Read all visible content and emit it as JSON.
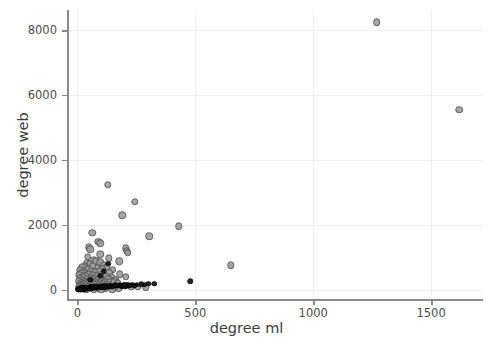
{
  "chart_data": {
    "type": "scatter",
    "title": "",
    "xlabel": "degree ml",
    "ylabel": "degree web",
    "xlim": [
      -40,
      1720
    ],
    "ylim": [
      -320,
      8620
    ],
    "xticks": [
      0,
      500,
      1000,
      1500
    ],
    "yticks": [
      0,
      2000,
      4000,
      6000,
      8000
    ],
    "xticklabels": [
      "0",
      "500",
      "1000",
      "1500"
    ],
    "yticklabels": [
      "0",
      "2000",
      "4000",
      "6000",
      "8000"
    ],
    "grid": true,
    "grid_color": "#f0f0f0",
    "legend": null,
    "series": [
      {
        "name": "gray-markers",
        "color": "#9a9a9a",
        "edge_color": "#4a4a4a",
        "marker": "circle",
        "size": 7.5,
        "points": [
          [
            1270,
            8250
          ],
          [
            1620,
            5550
          ],
          [
            128,
            3230
          ],
          [
            243,
            2710
          ],
          [
            190,
            2290
          ],
          [
            430,
            1960
          ],
          [
            305,
            1650
          ],
          [
            63,
            1760
          ],
          [
            88,
            1470
          ],
          [
            96,
            1430
          ],
          [
            47,
            1310
          ],
          [
            55,
            1240
          ],
          [
            205,
            1280
          ],
          [
            210,
            1195
          ],
          [
            213,
            1130
          ],
          [
            178,
            880
          ],
          [
            650,
            750
          ],
          [
            70,
            905
          ],
          [
            80,
            880
          ],
          [
            96,
            845
          ],
          [
            40,
            820
          ],
          [
            52,
            790
          ],
          [
            112,
            760
          ],
          [
            30,
            735
          ],
          [
            64,
            720
          ],
          [
            124,
            700
          ],
          [
            20,
            690
          ],
          [
            86,
            665
          ],
          [
            44,
            650
          ],
          [
            105,
            640
          ],
          [
            150,
            620
          ],
          [
            180,
            470
          ],
          [
            12,
            600
          ],
          [
            58,
            585
          ],
          [
            92,
            565
          ],
          [
            26,
            550
          ],
          [
            74,
            530
          ],
          [
            134,
            515
          ],
          [
            16,
            500
          ],
          [
            48,
            485
          ],
          [
            108,
            470
          ],
          [
            8,
            460
          ],
          [
            66,
            445
          ],
          [
            120,
            430
          ],
          [
            34,
            420
          ],
          [
            84,
            405
          ],
          [
            146,
            395
          ],
          [
            22,
            385
          ],
          [
            56,
            370
          ],
          [
            98,
            360
          ],
          [
            10,
            350
          ],
          [
            72,
            340
          ],
          [
            130,
            330
          ],
          [
            40,
            320
          ],
          [
            88,
            310
          ],
          [
            160,
            300
          ],
          [
            18,
            295
          ],
          [
            60,
            285
          ],
          [
            104,
            275
          ],
          [
            6,
            265
          ],
          [
            50,
            258
          ],
          [
            116,
            250
          ],
          [
            28,
            240
          ],
          [
            78,
            232
          ],
          [
            140,
            225
          ],
          [
            14,
            218
          ],
          [
            64,
            210
          ],
          [
            94,
            202
          ],
          [
            36,
            195
          ],
          [
            82,
            188
          ],
          [
            152,
            180
          ],
          [
            24,
            172
          ],
          [
            68,
            165
          ],
          [
            110,
            158
          ],
          [
            9,
            150
          ],
          [
            54,
            144
          ],
          [
            126,
            138
          ],
          [
            32,
            130
          ],
          [
            90,
            124
          ],
          [
            168,
            118
          ],
          [
            19,
            112
          ],
          [
            62,
            106
          ],
          [
            100,
            100
          ],
          [
            7,
            94
          ],
          [
            46,
            88
          ],
          [
            136,
            82
          ],
          [
            30,
            76
          ],
          [
            76,
            70
          ],
          [
            158,
            64
          ],
          [
            15,
            58
          ],
          [
            58,
            52
          ],
          [
            118,
            46
          ],
          [
            25,
            40
          ],
          [
            86,
            34
          ],
          [
            176,
            28
          ],
          [
            11,
            22
          ],
          [
            70,
            18
          ],
          [
            148,
            14
          ],
          [
            38,
            10
          ],
          [
            102,
            8
          ],
          [
            200,
            120
          ],
          [
            228,
            95
          ],
          [
            256,
            85
          ],
          [
            290,
            70
          ],
          [
            44,
            1020
          ],
          [
            96,
            1090
          ],
          [
            132,
            960
          ],
          [
            204,
            390
          ],
          [
            156,
            245
          ],
          [
            172,
            205
          ]
        ]
      },
      {
        "name": "black-markers",
        "color": "#131313",
        "edge_color": "#000000",
        "marker": "circle",
        "size": 5.5,
        "points": [
          [
            478,
            255
          ],
          [
            300,
            185
          ],
          [
            325,
            175
          ],
          [
            232,
            150
          ],
          [
            252,
            148
          ],
          [
            196,
            140
          ],
          [
            215,
            135
          ],
          [
            180,
            128
          ],
          [
            168,
            125
          ],
          [
            156,
            120
          ],
          [
            144,
            118
          ],
          [
            132,
            112
          ],
          [
            124,
            108
          ],
          [
            116,
            104
          ],
          [
            108,
            100
          ],
          [
            100,
            96
          ],
          [
            94,
            92
          ],
          [
            88,
            88
          ],
          [
            82,
            84
          ],
          [
            76,
            80
          ],
          [
            70,
            76
          ],
          [
            64,
            72
          ],
          [
            58,
            70
          ],
          [
            52,
            66
          ],
          [
            48,
            62
          ],
          [
            44,
            58
          ],
          [
            40,
            56
          ],
          [
            36,
            52
          ],
          [
            32,
            50
          ],
          [
            28,
            46
          ],
          [
            24,
            44
          ],
          [
            20,
            40
          ],
          [
            17,
            38
          ],
          [
            14,
            34
          ],
          [
            12,
            32
          ],
          [
            10,
            28
          ],
          [
            8,
            26
          ],
          [
            7,
            22
          ],
          [
            6,
            20
          ],
          [
            5,
            17
          ],
          [
            4,
            14
          ],
          [
            3,
            12
          ],
          [
            130,
            800
          ],
          [
            112,
            560
          ],
          [
            96,
            420
          ],
          [
            55,
            300
          ],
          [
            190,
            110
          ],
          [
            205,
            105
          ],
          [
            148,
            90
          ],
          [
            138,
            86
          ],
          [
            126,
            82
          ],
          [
            118,
            78
          ],
          [
            106,
            74
          ],
          [
            98,
            70
          ],
          [
            90,
            66
          ],
          [
            84,
            62
          ],
          [
            78,
            58
          ],
          [
            72,
            54
          ],
          [
            66,
            50
          ],
          [
            60,
            46
          ],
          [
            54,
            42
          ],
          [
            50,
            38
          ],
          [
            46,
            34
          ],
          [
            42,
            30
          ],
          [
            38,
            26
          ],
          [
            34,
            22
          ],
          [
            30,
            18
          ],
          [
            26,
            15
          ],
          [
            22,
            12
          ],
          [
            18,
            10
          ],
          [
            15,
            8
          ],
          [
            12,
            6
          ],
          [
            270,
            160
          ],
          [
            285,
            155
          ],
          [
            160,
            130
          ],
          [
            174,
            126
          ],
          [
            186,
            122
          ],
          [
            222,
            118
          ],
          [
            240,
            114
          ],
          [
            210,
            145
          ],
          [
            198,
            155
          ]
        ]
      }
    ]
  }
}
